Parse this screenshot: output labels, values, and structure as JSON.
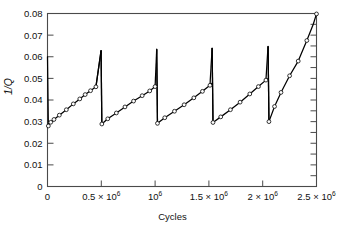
{
  "chart_data": {
    "type": "line",
    "title": "",
    "xlabel": "Cycles",
    "ylabel": "1/Q",
    "xlim": [
      0,
      2500000
    ],
    "ylim": [
      0,
      0.08
    ],
    "grid": false,
    "legend": null,
    "x_ticks": [
      {
        "value": 0,
        "label": "0"
      },
      {
        "value": 500000,
        "label": "0.5 × 10",
        "exp": "6"
      },
      {
        "value": 1000000,
        "label": "10",
        "exp": "6"
      },
      {
        "value": 1500000,
        "label": "1.5 × 10",
        "exp": "6"
      },
      {
        "value": 2000000,
        "label": "2 × 10",
        "exp": "6"
      },
      {
        "value": 2500000,
        "label": "2.5 × 10",
        "exp": "6"
      }
    ],
    "y_ticks": [
      {
        "value": 0,
        "label": "0"
      },
      {
        "value": 0.01,
        "label": "0.01"
      },
      {
        "value": 0.02,
        "label": "0.02"
      },
      {
        "value": 0.03,
        "label": "0.03"
      },
      {
        "value": 0.04,
        "label": "0.04"
      },
      {
        "value": 0.05,
        "label": "0.05"
      },
      {
        "value": 0.06,
        "label": "0.06"
      },
      {
        "value": 0.07,
        "label": "0.07"
      },
      {
        "value": 0.08,
        "label": "0.08"
      }
    ],
    "series": [
      {
        "name": "1/Q vs Cycles",
        "style": "sawtooth-line-with-open-circle-markers",
        "color": "#000000",
        "segments": [
          {
            "name": "initial-drop",
            "points": [
              [
                0,
                0.06
              ],
              [
                8000,
                0.028
              ]
            ]
          },
          {
            "name": "ramp-1",
            "points": [
              [
                8000,
                0.028
              ],
              [
                30000,
                0.0297
              ],
              [
                60000,
                0.031
              ],
              [
                110000,
                0.033
              ],
              [
                175000,
                0.0355
              ],
              [
                240000,
                0.0382
              ],
              [
                300000,
                0.0405
              ],
              [
                350000,
                0.0425
              ],
              [
                400000,
                0.0443
              ],
              [
                450000,
                0.0461
              ],
              [
                498000,
                0.0628
              ]
            ]
          },
          {
            "name": "drop-1",
            "points": [
              [
                498000,
                0.0628
              ],
              [
                505000,
                0.0289
              ]
            ]
          },
          {
            "name": "ramp-2",
            "points": [
              [
                505000,
                0.0289
              ],
              [
                560000,
                0.0313
              ],
              [
                640000,
                0.034
              ],
              [
                720000,
                0.0368
              ],
              [
                800000,
                0.0395
              ],
              [
                880000,
                0.042
              ],
              [
                950000,
                0.0442
              ],
              [
                1000000,
                0.0462
              ],
              [
                1015000,
                0.0468
              ]
            ]
          },
          {
            "name": "drop-2",
            "points": [
              [
                1015000,
                0.0635
              ],
              [
                1022000,
                0.0292
              ]
            ]
          },
          {
            "name": "ramp-3",
            "points": [
              [
                1022000,
                0.0292
              ],
              [
                1090000,
                0.0318
              ],
              [
                1180000,
                0.0348
              ],
              [
                1270000,
                0.0378
              ],
              [
                1360000,
                0.041
              ],
              [
                1440000,
                0.044
              ],
              [
                1510000,
                0.0468
              ],
              [
                1530000,
                0.0478
              ]
            ]
          },
          {
            "name": "drop-3",
            "points": [
              [
                1530000,
                0.064
              ],
              [
                1538000,
                0.0296
              ]
            ]
          },
          {
            "name": "ramp-4",
            "points": [
              [
                1538000,
                0.0296
              ],
              [
                1610000,
                0.0322
              ],
              [
                1700000,
                0.0355
              ],
              [
                1790000,
                0.039
              ],
              [
                1880000,
                0.0428
              ],
              [
                1960000,
                0.0462
              ],
              [
                2030000,
                0.0492
              ],
              [
                2050000,
                0.05
              ]
            ]
          },
          {
            "name": "drop-4",
            "points": [
              [
                2050000,
                0.0648
              ],
              [
                2058000,
                0.03
              ]
            ]
          },
          {
            "name": "ramp-5-final",
            "points": [
              [
                2058000,
                0.03
              ],
              [
                2110000,
                0.037
              ],
              [
                2170000,
                0.0435
              ],
              [
                2250000,
                0.0512
              ],
              [
                2330000,
                0.058
              ],
              [
                2410000,
                0.0675
              ],
              [
                2470000,
                0.075
              ],
              [
                2500000,
                0.0798
              ]
            ]
          }
        ],
        "markers": [
          [
            30000,
            0.0297
          ],
          [
            60000,
            0.031
          ],
          [
            110000,
            0.033
          ],
          [
            175000,
            0.0355
          ],
          [
            240000,
            0.0382
          ],
          [
            300000,
            0.0405
          ],
          [
            350000,
            0.0425
          ],
          [
            400000,
            0.0443
          ],
          [
            450000,
            0.0461
          ],
          [
            560000,
            0.0313
          ],
          [
            640000,
            0.034
          ],
          [
            720000,
            0.0368
          ],
          [
            800000,
            0.0395
          ],
          [
            880000,
            0.042
          ],
          [
            950000,
            0.0442
          ],
          [
            1000000,
            0.0462
          ],
          [
            1090000,
            0.0318
          ],
          [
            1180000,
            0.0348
          ],
          [
            1270000,
            0.0378
          ],
          [
            1360000,
            0.041
          ],
          [
            1440000,
            0.044
          ],
          [
            1510000,
            0.0468
          ],
          [
            1610000,
            0.0322
          ],
          [
            1700000,
            0.0355
          ],
          [
            1790000,
            0.039
          ],
          [
            1880000,
            0.0428
          ],
          [
            1960000,
            0.0462
          ],
          [
            2030000,
            0.0492
          ],
          [
            2110000,
            0.037
          ],
          [
            2170000,
            0.0435
          ],
          [
            2250000,
            0.0512
          ],
          [
            2330000,
            0.058
          ],
          [
            2410000,
            0.0675
          ],
          [
            2500000,
            0.0798
          ],
          [
            8000,
            0.028
          ],
          [
            505000,
            0.0289
          ],
          [
            1022000,
            0.0292
          ],
          [
            1538000,
            0.0296
          ],
          [
            2058000,
            0.03
          ]
        ]
      }
    ],
    "colors": {
      "axis": "#4a4a4a",
      "line": "#111111",
      "marker_stroke": "#111111",
      "marker_fill": "#ffffff",
      "background": "#ffffff"
    }
  }
}
